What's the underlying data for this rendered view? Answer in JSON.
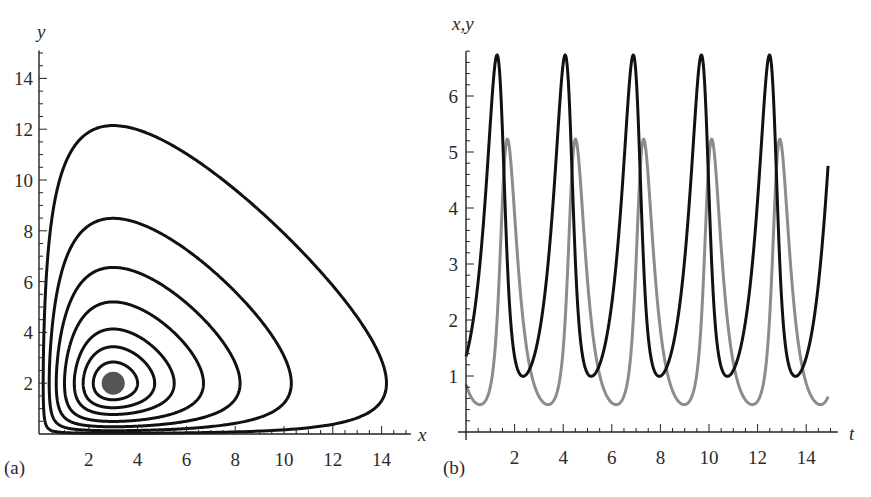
{
  "chart_data": [
    {
      "id": "a",
      "type": "line",
      "subtype": "phase-portrait",
      "panel_label": "(a)",
      "title": "",
      "xlabel": "x",
      "ylabel": "y",
      "xlim": [
        0,
        15
      ],
      "ylim": [
        0,
        15
      ],
      "xticks": [
        2,
        4,
        6,
        8,
        10,
        12,
        14
      ],
      "yticks": [
        2,
        4,
        6,
        8,
        10,
        12,
        14
      ],
      "grid": false,
      "legend": null,
      "model": {
        "name": "Lotka-Volterra",
        "a": 2,
        "b": 1,
        "c": 3,
        "d": 1
      },
      "fixed_point": {
        "x": 3,
        "y": 2,
        "color": "#555555"
      },
      "orbits": [
        {
          "max_x": 4.0,
          "max_y": 2.8
        },
        {
          "max_x": 4.7,
          "max_y": 3.4
        },
        {
          "max_x": 5.5,
          "max_y": 4.2
        },
        {
          "max_x": 6.7,
          "max_y": 5.1
        },
        {
          "max_x": 8.2,
          "max_y": 6.5
        },
        {
          "max_x": 10.3,
          "max_y": 8.5
        },
        {
          "max_x": 14.2,
          "max_y": 12.2
        }
      ],
      "line_color": "#111111"
    },
    {
      "id": "b",
      "type": "line",
      "subtype": "time-series",
      "panel_label": "(b)",
      "title": "",
      "xlabel": "t",
      "ylabel": "x,y",
      "xlim": [
        0,
        15
      ],
      "ylim": [
        0,
        6.8
      ],
      "xticks": [
        2,
        4,
        6,
        8,
        10,
        12,
        14
      ],
      "yticks": [
        1,
        2,
        3,
        4,
        5,
        6
      ],
      "grid": false,
      "legend": null,
      "t_range": [
        0,
        14.9
      ],
      "initial": {
        "x": 1.35,
        "y": 0.85
      },
      "series": [
        {
          "name": "x",
          "color": "#111111",
          "peak": 6.65,
          "min": 1.0,
          "start": 1.35,
          "end": 5.48,
          "peak_times": [
            1.2,
            4.0,
            6.8,
            9.6,
            12.4
          ]
        },
        {
          "name": "y",
          "color": "#8c8c8c",
          "peak": 5.17,
          "min": 0.5,
          "start": 0.85,
          "end": 0.8,
          "peak_times": [
            1.65,
            4.45,
            7.25,
            10.05,
            12.85
          ]
        }
      ]
    }
  ]
}
